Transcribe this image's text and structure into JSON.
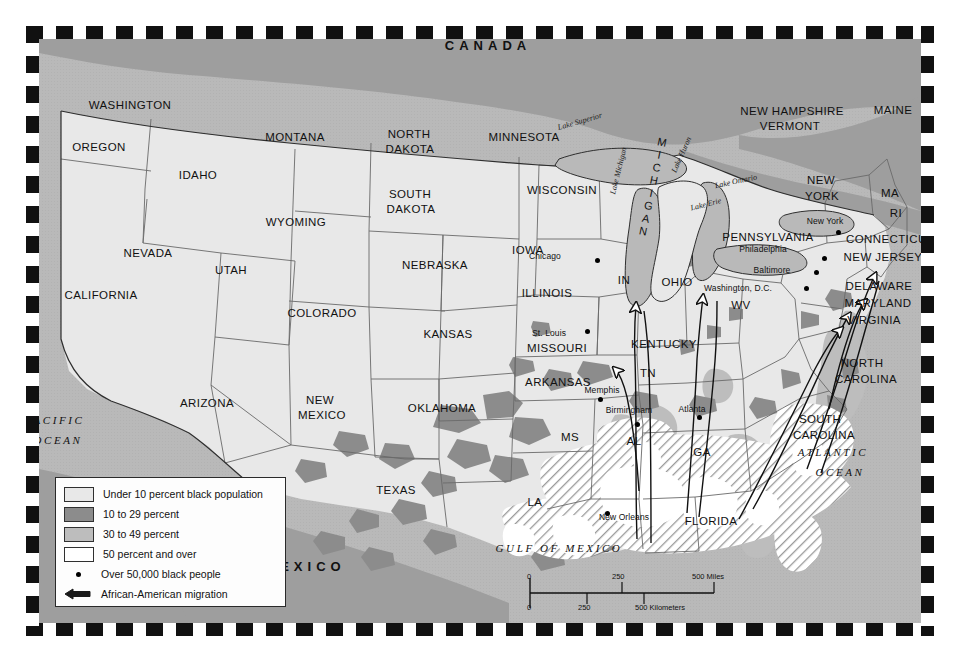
{
  "map": {
    "countries": [
      {
        "name": "CANADA",
        "x": 488,
        "y": 46
      },
      {
        "name": "MEXICO",
        "x": 305,
        "y": 567
      }
    ],
    "oceans": [
      {
        "name": "PACIFIC",
        "x": 55,
        "y": 421
      },
      {
        "name": "OCEAN",
        "x": 58,
        "y": 441
      },
      {
        "name": "ATLANTIC",
        "x": 833,
        "y": 453
      },
      {
        "name": "OCEAN",
        "x": 840,
        "y": 473
      },
      {
        "name": "GULF OF MEXICO",
        "x": 559,
        "y": 549
      }
    ],
    "lakes": [
      {
        "name": "Lake Superior",
        "x": 580,
        "y": 122
      },
      {
        "name": "Lake Michigan",
        "x": 619,
        "y": 171
      },
      {
        "name": "Lake Huron",
        "x": 682,
        "y": 155
      },
      {
        "name": "Lake Erie",
        "x": 706,
        "y": 205
      },
      {
        "name": "Lake Ontario",
        "x": 736,
        "y": 182
      }
    ],
    "michigan_vertical": "MICHIGAN",
    "states": [
      {
        "name": "WASHINGTON",
        "x": 130,
        "y": 105,
        "size": "state"
      },
      {
        "name": "OREGON",
        "x": 99,
        "y": 147,
        "size": "state"
      },
      {
        "name": "IDAHO",
        "x": 198,
        "y": 175,
        "size": "state"
      },
      {
        "name": "MONTANA",
        "x": 295,
        "y": 137,
        "size": "state"
      },
      {
        "name": "WYOMING",
        "x": 296,
        "y": 222,
        "size": "state"
      },
      {
        "name": "NEVADA",
        "x": 148,
        "y": 253,
        "size": "state"
      },
      {
        "name": "UTAH",
        "x": 231,
        "y": 270,
        "size": "state"
      },
      {
        "name": "CALIFORNIA",
        "x": 101,
        "y": 295,
        "size": "state"
      },
      {
        "name": "ARIZONA",
        "x": 207,
        "y": 403,
        "size": "state"
      },
      {
        "name": "COLORADO",
        "x": 322,
        "y": 313,
        "size": "state"
      },
      {
        "name": "NEW",
        "x": 320,
        "y": 400,
        "size": "state"
      },
      {
        "name": "MEXICO",
        "x": 322,
        "y": 415,
        "size": "state"
      },
      {
        "name": "NORTH",
        "x": 409,
        "y": 134,
        "size": "state"
      },
      {
        "name": "DAKOTA",
        "x": 410,
        "y": 149,
        "size": "state"
      },
      {
        "name": "SOUTH",
        "x": 410,
        "y": 194,
        "size": "state"
      },
      {
        "name": "DAKOTA",
        "x": 411,
        "y": 209,
        "size": "state"
      },
      {
        "name": "NEBRASKA",
        "x": 435,
        "y": 265,
        "size": "state"
      },
      {
        "name": "KANSAS",
        "x": 448,
        "y": 334,
        "size": "state"
      },
      {
        "name": "OKLAHOMA",
        "x": 442,
        "y": 408,
        "size": "state"
      },
      {
        "name": "TEXAS",
        "x": 396,
        "y": 490,
        "size": "state"
      },
      {
        "name": "MINNESOTA",
        "x": 524,
        "y": 137,
        "size": "state"
      },
      {
        "name": "IOWA",
        "x": 528,
        "y": 250,
        "size": "state"
      },
      {
        "name": "MISSOURI",
        "x": 557,
        "y": 348,
        "size": "state"
      },
      {
        "name": "ARKANSAS",
        "x": 558,
        "y": 382,
        "size": "state"
      },
      {
        "name": "WISCONSIN",
        "x": 562,
        "y": 190,
        "size": "state"
      },
      {
        "name": "ILLINOIS",
        "x": 547,
        "y": 293,
        "size": "state"
      },
      {
        "name": "IN",
        "x": 624,
        "y": 280,
        "size": "state"
      },
      {
        "name": "OHIO",
        "x": 677,
        "y": 282,
        "size": "state"
      },
      {
        "name": "KENTUCKY",
        "x": 664,
        "y": 344,
        "size": "state"
      },
      {
        "name": "TN",
        "x": 648,
        "y": 373,
        "size": "state"
      },
      {
        "name": "MS",
        "x": 570,
        "y": 437,
        "size": "state"
      },
      {
        "name": "AL",
        "x": 634,
        "y": 441,
        "size": "state"
      },
      {
        "name": "GA",
        "x": 702,
        "y": 452,
        "size": "state"
      },
      {
        "name": "LA",
        "x": 535,
        "y": 502,
        "size": "state"
      },
      {
        "name": "FLORIDA",
        "x": 711,
        "y": 521,
        "size": "state"
      },
      {
        "name": "WV",
        "x": 741,
        "y": 305,
        "size": "state"
      },
      {
        "name": "PENNSYLVANIA",
        "x": 768,
        "y": 237,
        "size": "state"
      },
      {
        "name": "NEW",
        "x": 821,
        "y": 180,
        "size": "state"
      },
      {
        "name": "YORK",
        "x": 822,
        "y": 196,
        "size": "state"
      },
      {
        "name": "MAINE",
        "x": 893,
        "y": 110,
        "size": "state"
      },
      {
        "name": "NEW HAMPSHIRE",
        "x": 792,
        "y": 111,
        "size": "state"
      },
      {
        "name": "VERMONT",
        "x": 790,
        "y": 126,
        "size": "state"
      },
      {
        "name": "MA",
        "x": 890,
        "y": 193,
        "size": "state"
      },
      {
        "name": "RI",
        "x": 896,
        "y": 213,
        "size": "state"
      },
      {
        "name": "CONNECTICUT",
        "x": 890,
        "y": 239,
        "size": "state"
      },
      {
        "name": "NEW JERSEY",
        "x": 883,
        "y": 257,
        "size": "state"
      },
      {
        "name": "DELAWARE",
        "x": 879,
        "y": 286,
        "size": "state"
      },
      {
        "name": "MARYLAND",
        "x": 878,
        "y": 303,
        "size": "state"
      },
      {
        "name": "VIRGINIA",
        "x": 874,
        "y": 320,
        "size": "state"
      },
      {
        "name": "NORTH",
        "x": 862,
        "y": 363,
        "size": "state"
      },
      {
        "name": "CAROLINA",
        "x": 866,
        "y": 379,
        "size": "state"
      },
      {
        "name": "SOUTH",
        "x": 820,
        "y": 419,
        "size": "state"
      },
      {
        "name": "CAROLINA",
        "x": 824,
        "y": 435,
        "size": "state"
      }
    ],
    "cities": [
      {
        "name": "Chicago",
        "label_x": 545,
        "label_y": 256,
        "dot_x": 597,
        "dot_y": 260
      },
      {
        "name": "St. Louis",
        "label_x": 549,
        "label_y": 333,
        "dot_x": 587,
        "dot_y": 331
      },
      {
        "name": "Memphis",
        "label_x": 602,
        "label_y": 390,
        "dot_x": 600,
        "dot_y": 399
      },
      {
        "name": "Birmingham",
        "label_x": 629,
        "label_y": 410,
        "dot_x": 637,
        "dot_y": 424
      },
      {
        "name": "Atlanta",
        "label_x": 692,
        "label_y": 409,
        "dot_x": 699,
        "dot_y": 417
      },
      {
        "name": "New Orleans",
        "label_x": 624,
        "label_y": 517,
        "dot_x": 607,
        "dot_y": 513
      },
      {
        "name": "New York",
        "label_x": 825,
        "label_y": 221,
        "dot_x": 838,
        "dot_y": 232
      },
      {
        "name": "Philadelphia",
        "label_x": 763,
        "label_y": 249,
        "dot_x": 824,
        "dot_y": 258
      },
      {
        "name": "Baltimore",
        "label_x": 772,
        "label_y": 270,
        "dot_x": 816,
        "dot_y": 272
      },
      {
        "name": "Washington, D.C.",
        "label_x": 738,
        "label_y": 288,
        "dot_x": 806,
        "dot_y": 288
      }
    ]
  },
  "legend": {
    "items": [
      {
        "swatch": "under-10",
        "label": "Under 10 percent black population",
        "color": "#e8e8e8"
      },
      {
        "swatch": "10-29",
        "label": "10 to 29 percent",
        "color": "#8c8c8c"
      },
      {
        "swatch": "30-49",
        "label": "30 to 49 percent",
        "color": "#bdbdbd"
      },
      {
        "swatch": "50-over",
        "label": "50 percent and over",
        "color": "#ffffff"
      }
    ],
    "dot_label": "Over 50,000 black people",
    "arrow_label": "African-American migration"
  },
  "scale": {
    "miles_ticks": [
      "0",
      "250",
      "500 Miles"
    ],
    "km_ticks": [
      "0",
      "250",
      "500 Kilometers"
    ]
  },
  "colors": {
    "under10": "#e8e8e8",
    "p10_29": "#8c8c8c",
    "p30_49": "#bdbdbd",
    "p50_over": "#ffffff",
    "water": "#b9b9b9",
    "land_outside": "#a8a8a8",
    "border": "#3a3a3a"
  }
}
